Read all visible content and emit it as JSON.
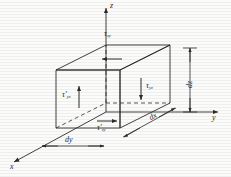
{
  "figure": {
    "type": "engineering-diagram",
    "background_color": "#fbfbfa",
    "line_color": "#2b2b2b",
    "axes": [
      {
        "name": "z-axis",
        "label": "z",
        "direction": "up"
      },
      {
        "name": "y-axis",
        "label": "y",
        "direction": "right"
      },
      {
        "name": "x-axis",
        "label": "x",
        "direction": "down-left"
      }
    ],
    "stress_labels": [
      {
        "name": "tau-top",
        "symbol": "τ",
        "prime": "",
        "subscript": "zy",
        "arrow": "left"
      },
      {
        "name": "tau-right",
        "symbol": "τ",
        "prime": "",
        "subscript": "yz",
        "arrow": "down"
      },
      {
        "name": "tau-left",
        "symbol": "τ",
        "prime": "′",
        "subscript": "yz",
        "arrow": "up"
      },
      {
        "name": "tau-bottom",
        "symbol": "τ",
        "prime": "′",
        "subscript": "zy",
        "arrow": "right"
      }
    ],
    "dimensions": [
      {
        "name": "dz",
        "label": "dz",
        "orientation": "vertical",
        "position": "right"
      },
      {
        "name": "dx",
        "label": "dx",
        "orientation": "oblique",
        "position": "bottom-right"
      },
      {
        "name": "dy",
        "label": "dy",
        "orientation": "horizontal",
        "position": "bottom-center"
      }
    ],
    "element": {
      "name": "differential-cube",
      "face_style": "wireframe",
      "hidden_edges": "dashed"
    }
  }
}
